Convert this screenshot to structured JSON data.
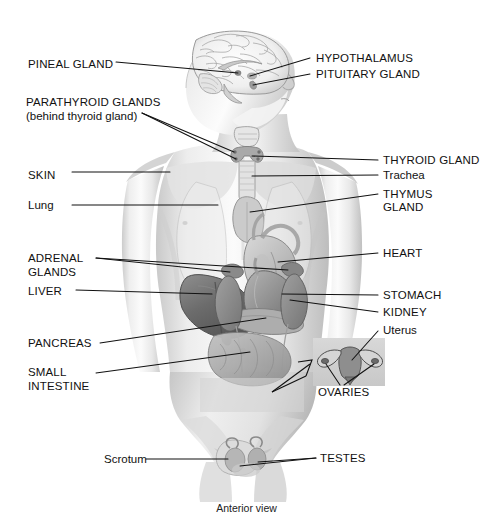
{
  "figure": {
    "title_caption": "Anterior view",
    "view": "Anterior view",
    "background_color": "#ffffff",
    "line_color": "#111111",
    "art_style": "grayscale pencil/airbrush medical illustration"
  },
  "labels_left": [
    {
      "id": "pineal-gland",
      "text": "PINEAL GLAND",
      "style": "caps",
      "x": 28,
      "y": 58
    },
    {
      "id": "parathyroid-glands",
      "text": "PARATHYROID GLANDS",
      "style": "caps",
      "x": 26,
      "y": 96
    },
    {
      "id": "parathyroid-note",
      "text": "(behind thyroid gland)",
      "style": "mixed",
      "x": 26,
      "y": 110
    },
    {
      "id": "skin",
      "text": "SKIN",
      "style": "caps",
      "x": 28,
      "y": 175
    },
    {
      "id": "lung",
      "text": "Lung",
      "style": "mixed",
      "x": 28,
      "y": 206
    },
    {
      "id": "adrenal-glands-1",
      "text": "ADRENAL",
      "style": "caps",
      "x": 28,
      "y": 255
    },
    {
      "id": "adrenal-glands-2",
      "text": "GLANDS",
      "style": "caps",
      "x": 28,
      "y": 268
    },
    {
      "id": "liver",
      "text": "LIVER",
      "style": "caps",
      "x": 28,
      "y": 292
    },
    {
      "id": "pancreas",
      "text": "PANCREAS",
      "style": "caps",
      "x": 28,
      "y": 340
    },
    {
      "id": "small-intestine-1",
      "text": "SMALL",
      "style": "caps",
      "x": 28,
      "y": 369
    },
    {
      "id": "small-intestine-2",
      "text": "INTESTINE",
      "style": "caps",
      "x": 28,
      "y": 383
    },
    {
      "id": "scrotum",
      "text": "Scrotum",
      "style": "mixed",
      "x": 104,
      "y": 456
    }
  ],
  "labels_right": [
    {
      "id": "hypothalamus",
      "text": "HYPOTHALAMUS",
      "style": "caps",
      "x": 316,
      "y": 55
    },
    {
      "id": "pituitary-gland",
      "text": "PITUITARY GLAND",
      "style": "caps",
      "x": 316,
      "y": 71
    },
    {
      "id": "thyroid-gland",
      "text": "THYROID GLAND",
      "style": "caps",
      "x": 383,
      "y": 157
    },
    {
      "id": "trachea",
      "text": "Trachea",
      "style": "mixed",
      "x": 383,
      "y": 172
    },
    {
      "id": "thymus-gland-1",
      "text": "THYMUS",
      "style": "caps",
      "x": 383,
      "y": 191
    },
    {
      "id": "thymus-gland-2",
      "text": "GLAND",
      "style": "caps",
      "x": 383,
      "y": 204
    },
    {
      "id": "heart",
      "text": "HEART",
      "style": "caps",
      "x": 383,
      "y": 250
    },
    {
      "id": "stomach",
      "text": "STOMACH",
      "style": "caps",
      "x": 383,
      "y": 292
    },
    {
      "id": "kidney",
      "text": "KIDNEY",
      "style": "caps",
      "x": 383,
      "y": 309
    },
    {
      "id": "uterus",
      "text": "Uterus",
      "style": "mixed",
      "x": 383,
      "y": 327
    },
    {
      "id": "ovaries",
      "text": "OVARIES",
      "style": "caps",
      "x": 318,
      "y": 389
    },
    {
      "id": "testes",
      "text": "TESTES",
      "style": "caps",
      "x": 320,
      "y": 455
    }
  ],
  "organs_depicted": [
    "brain",
    "pineal gland",
    "hypothalamus",
    "pituitary gland",
    "thyroid gland",
    "parathyroid glands",
    "trachea",
    "thymus gland",
    "heart",
    "lung",
    "liver",
    "stomach",
    "pancreas",
    "adrenal glands",
    "kidney",
    "small intestine",
    "skin",
    "uterus",
    "ovaries",
    "scrotum",
    "testes"
  ],
  "inset": {
    "name": "uterus-ovaries-inset",
    "callout_arrow": "diagonal arrow from lower-left pelvis to inset box",
    "box": {
      "x": 313,
      "y": 338,
      "w": 72,
      "h": 48
    }
  },
  "colors": {
    "ink": "#111111",
    "paper": "#ffffff",
    "skin_light": "#f3f3f3",
    "skin_mid": "#d8d8d8",
    "skin_shadow": "#a8a8a8",
    "organ_dark": "#6e6e6e",
    "organ_mid": "#9a9a9a",
    "brain_line": "#8c8c8c"
  }
}
